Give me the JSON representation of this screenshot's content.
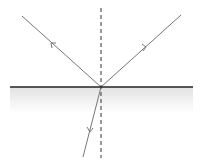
{
  "diagram": {
    "type": "light reflection and refraction at an interface",
    "colors": {
      "ray": "#777777",
      "interface": "#222222",
      "normal": "#333333",
      "medium_top": "#e6e6e6",
      "medium_bottom": "#ffffff"
    },
    "interface": {
      "x1": 10,
      "y1": 87,
      "x2": 193,
      "y2": 87
    },
    "normal": {
      "x": 101,
      "y1": 8,
      "y2": 158,
      "style": "dashed"
    },
    "point_of_incidence": {
      "x": 101,
      "y": 87
    },
    "rays": [
      {
        "name": "incident-ray",
        "from": [
          181,
          15
        ],
        "to": [
          101,
          87
        ],
        "arrow_at": [
          146,
          47
        ]
      },
      {
        "name": "reflected-ray",
        "from": [
          101,
          87
        ],
        "to": [
          22,
          16
        ],
        "arrow_at": [
          53,
          44
        ]
      },
      {
        "name": "refracted-ray",
        "from": [
          101,
          87
        ],
        "to": [
          83,
          157
        ],
        "arrow_at": [
          90,
          131
        ]
      }
    ]
  }
}
